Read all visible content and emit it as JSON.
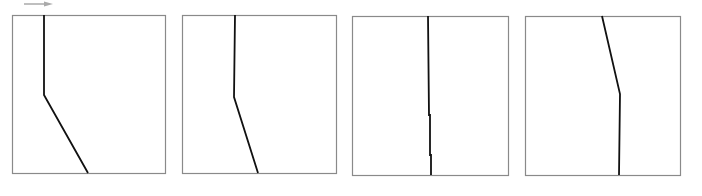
{
  "panels": [
    {
      "box": [
        12,
        15,
        165,
        173
      ],
      "line": [
        [
          44,
          15
        ],
        [
          44,
          95
        ],
        [
          88,
          173
        ]
      ]
    },
    {
      "box": [
        182,
        15,
        336,
        173
      ],
      "line": [
        [
          235,
          15
        ],
        [
          234,
          97
        ],
        [
          258,
          173
        ]
      ]
    },
    {
      "box": [
        352,
        16,
        508,
        175
      ],
      "line": [
        [
          428,
          16
        ],
        [
          429,
          115
        ],
        [
          430,
          115
        ],
        [
          430,
          155
        ],
        [
          431,
          155
        ],
        [
          431,
          175
        ]
      ]
    },
    {
      "box": [
        525,
        16,
        680,
        175
      ],
      "line": [
        [
          602,
          16
        ],
        [
          620,
          94
        ],
        [
          619,
          175
        ]
      ]
    }
  ],
  "arrow": {
    "from": [
      24,
      4
    ],
    "to": [
      53,
      4
    ],
    "color": "#aaaaaa"
  },
  "colors": {
    "box_border": "#8a8a8a",
    "line": "#111111"
  }
}
